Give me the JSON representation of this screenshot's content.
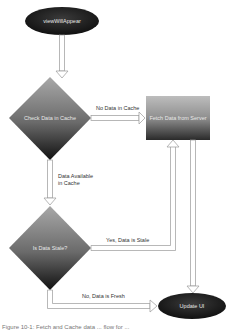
{
  "diagram": {
    "type": "flowchart",
    "nodes": {
      "start": {
        "label": "viewWillAppear",
        "shape": "ellipse"
      },
      "check_cache": {
        "label": "Check Data in Cache",
        "shape": "diamond"
      },
      "fetch": {
        "label": "Fetch Data from Server",
        "shape": "rectangle"
      },
      "is_stale": {
        "label": "Is Data Stale?",
        "shape": "diamond"
      },
      "update_ui": {
        "label": "Update UI",
        "shape": "ellipse"
      }
    },
    "edges": {
      "no_data": {
        "label": "No Data in Cache"
      },
      "data_available_1": {
        "label": "Data Available"
      },
      "data_available_2": {
        "label": "in Cache"
      },
      "stale": {
        "label": "Yes, Data is Stale"
      },
      "fresh": {
        "label": "No, Data is Fresh"
      }
    },
    "caption": "Figure 10-1: Fetch and Cache data ... flow for ..."
  },
  "colors": {
    "node_dark": "#1a1a1a",
    "node_mid": "#8a8a8a",
    "arrow_stroke": "#999999",
    "label_text": "#333333"
  }
}
